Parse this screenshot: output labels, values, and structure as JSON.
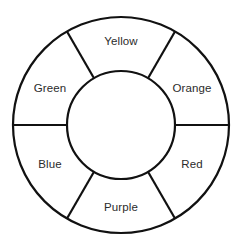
{
  "figure": {
    "name": "color-wheel",
    "background_color": "#ffffff",
    "stroke_color": "#111111",
    "text_color": "#2b2b2b",
    "width": 242,
    "height": 251
  },
  "wheel": {
    "center_x": 121,
    "center_y": 125,
    "outer_radius": 108,
    "inner_radius": 54,
    "sector_count": 6,
    "spoke_angles_deg": [
      0,
      60,
      120,
      180,
      240,
      300
    ],
    "sectors": [
      {
        "id": "yellow",
        "label": "Yellow",
        "angle_deg": 90,
        "label_x": 121,
        "label_y": 42
      },
      {
        "id": "orange",
        "label": "Orange",
        "angle_deg": 30,
        "label_x": 192,
        "label_y": 89
      },
      {
        "id": "red",
        "label": "Red",
        "angle_deg": 330,
        "label_x": 192,
        "label_y": 165
      },
      {
        "id": "purple",
        "label": "Purple",
        "angle_deg": 270,
        "label_x": 121,
        "label_y": 208
      },
      {
        "id": "blue",
        "label": "Blue",
        "angle_deg": 210,
        "label_x": 50,
        "label_y": 165
      },
      {
        "id": "green",
        "label": "Green",
        "angle_deg": 150,
        "label_x": 50,
        "label_y": 89
      }
    ]
  }
}
